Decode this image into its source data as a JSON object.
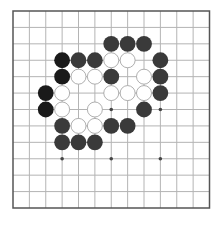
{
  "board": {
    "size": 13,
    "star_points": [
      [
        3,
        3
      ],
      [
        6,
        3
      ],
      [
        9,
        3
      ],
      [
        3,
        6
      ],
      [
        6,
        6
      ],
      [
        9,
        6
      ],
      [
        3,
        9
      ],
      [
        6,
        9
      ],
      [
        9,
        9
      ]
    ],
    "colors": {
      "background": "#ffffff",
      "grid_line": "#b4b4b4",
      "border_line": "#555555",
      "black_stone_dark": "#1a1a1a",
      "black_stone": "#3a3a3a",
      "white_stone_fill": "#ffffff",
      "white_stone_edge": "#9a9a9a",
      "star_point": "#444444"
    }
  },
  "stones": [
    {
      "color": "black",
      "tone": "dark",
      "col": 3,
      "row": 3
    },
    {
      "color": "black",
      "tone": "dark",
      "col": 3,
      "row": 4
    },
    {
      "color": "black",
      "tone": "dark",
      "col": 2,
      "row": 5
    },
    {
      "color": "black",
      "tone": "dark",
      "col": 2,
      "row": 6
    },
    {
      "color": "black",
      "tone": "normal",
      "col": 6,
      "row": 2
    },
    {
      "color": "black",
      "tone": "normal",
      "col": 7,
      "row": 2
    },
    {
      "color": "black",
      "tone": "normal",
      "col": 8,
      "row": 2
    },
    {
      "color": "black",
      "tone": "normal",
      "col": 4,
      "row": 3
    },
    {
      "color": "black",
      "tone": "normal",
      "col": 5,
      "row": 3
    },
    {
      "color": "black",
      "tone": "normal",
      "col": 9,
      "row": 3
    },
    {
      "color": "black",
      "tone": "normal",
      "col": 6,
      "row": 4
    },
    {
      "color": "black",
      "tone": "normal",
      "col": 9,
      "row": 4
    },
    {
      "color": "black",
      "tone": "normal",
      "col": 9,
      "row": 5
    },
    {
      "color": "black",
      "tone": "normal",
      "col": 8,
      "row": 6
    },
    {
      "color": "black",
      "tone": "normal",
      "col": 3,
      "row": 7
    },
    {
      "color": "black",
      "tone": "normal",
      "col": 6,
      "row": 7
    },
    {
      "color": "black",
      "tone": "normal",
      "col": 7,
      "row": 7
    },
    {
      "color": "black",
      "tone": "normal",
      "col": 3,
      "row": 8
    },
    {
      "color": "black",
      "tone": "normal",
      "col": 4,
      "row": 8
    },
    {
      "color": "black",
      "tone": "normal",
      "col": 5,
      "row": 8
    },
    {
      "color": "white",
      "col": 6,
      "row": 3
    },
    {
      "color": "white",
      "col": 7,
      "row": 3
    },
    {
      "color": "white",
      "col": 4,
      "row": 4
    },
    {
      "color": "white",
      "col": 5,
      "row": 4
    },
    {
      "color": "white",
      "col": 8,
      "row": 4
    },
    {
      "color": "white",
      "col": 3,
      "row": 5
    },
    {
      "color": "white",
      "col": 6,
      "row": 5
    },
    {
      "color": "white",
      "col": 7,
      "row": 5
    },
    {
      "color": "white",
      "col": 8,
      "row": 5
    },
    {
      "color": "white",
      "col": 3,
      "row": 6
    },
    {
      "color": "white",
      "col": 5,
      "row": 6
    },
    {
      "color": "white",
      "col": 4,
      "row": 7
    },
    {
      "color": "white",
      "col": 5,
      "row": 7
    }
  ]
}
